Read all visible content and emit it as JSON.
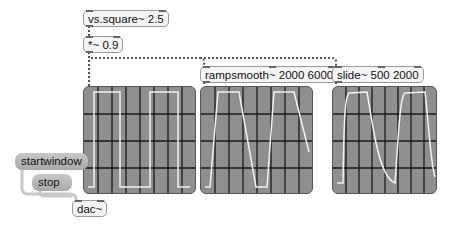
{
  "objects": {
    "square": {
      "label": "vs.square~ 2.5"
    },
    "mult": {
      "label": "*~ 0.9"
    },
    "rampsmooth": {
      "label": "rampsmooth~ 2000 6000"
    },
    "slide": {
      "label": "slide~ 500 2000"
    },
    "dac": {
      "label": "dac~"
    }
  },
  "messages": {
    "startwindow": {
      "label": "startwindow"
    },
    "stop": {
      "label": "stop"
    }
  },
  "scopes": [
    {
      "name": "scope-square",
      "waveform": "square"
    },
    {
      "name": "scope-rampsmooth",
      "waveform": "ramp-smoothed square"
    },
    {
      "name": "scope-slide",
      "waveform": "slide-smoothed square"
    }
  ],
  "colors": {
    "scope_bg": "#8f8f8f",
    "scope_grid": "#1a1a1a",
    "trace": "#f2f2f2",
    "signal_patchcord": "#555555",
    "control_patchcord": "#c8c8c8"
  }
}
